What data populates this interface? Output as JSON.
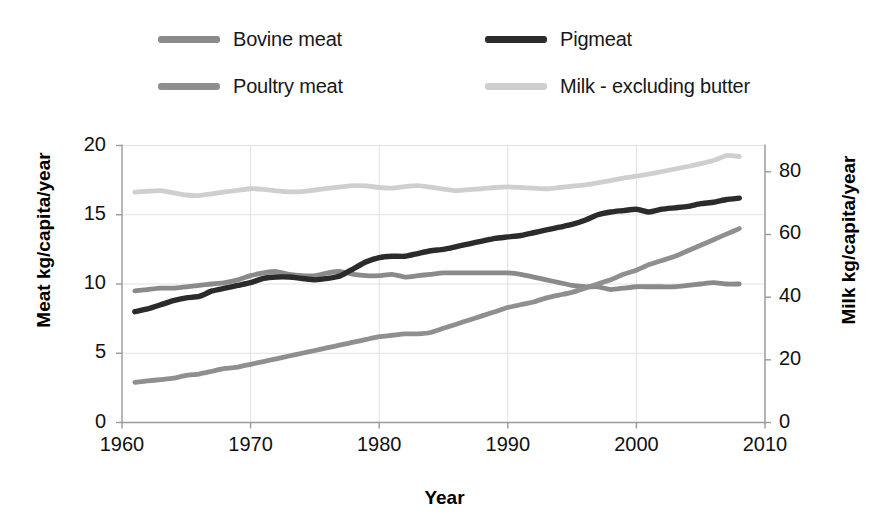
{
  "chart_data": {
    "type": "line",
    "title": "",
    "xlabel": "Year",
    "ylabel": "Meat kg/capita/year",
    "ylabel_secondary": "Milk kg/capita/year",
    "xlim": [
      1960,
      2010
    ],
    "ylim": [
      0,
      20
    ],
    "ylim_secondary": [
      0,
      88.4
    ],
    "xticks": [
      "1960",
      "1970",
      "1980",
      "1990",
      "2000",
      "2010"
    ],
    "xtick_values": [
      1960,
      1970,
      1980,
      1990,
      2000,
      2010
    ],
    "yticks": [
      "0",
      "5",
      "10",
      "15",
      "20"
    ],
    "ytick_values": [
      0,
      5,
      10,
      15,
      20
    ],
    "yticks_secondary": [
      "0",
      "20",
      "40",
      "60",
      "80"
    ],
    "ytick_values_secondary": [
      0,
      20,
      40,
      60,
      80
    ],
    "grid": true,
    "legend_position": "top",
    "x": [
      1961,
      1962,
      1963,
      1964,
      1965,
      1966,
      1967,
      1968,
      1969,
      1970,
      1971,
      1972,
      1973,
      1974,
      1975,
      1976,
      1977,
      1978,
      1979,
      1980,
      1981,
      1982,
      1983,
      1984,
      1985,
      1986,
      1987,
      1988,
      1989,
      1990,
      1991,
      1992,
      1993,
      1994,
      1995,
      1996,
      1997,
      1998,
      1999,
      2000,
      2001,
      2002,
      2003,
      2004,
      2005,
      2006,
      2007,
      2008
    ],
    "series": [
      {
        "name": "Bovine meat",
        "axis": "left",
        "color": "#8a8a8a",
        "values": [
          9.5,
          9.6,
          9.7,
          9.7,
          9.8,
          9.9,
          10.0,
          10.1,
          10.3,
          10.6,
          10.8,
          10.9,
          10.7,
          10.6,
          10.6,
          10.8,
          10.9,
          10.7,
          10.6,
          10.6,
          10.7,
          10.5,
          10.6,
          10.7,
          10.8,
          10.8,
          10.8,
          10.8,
          10.8,
          10.8,
          10.7,
          10.5,
          10.3,
          10.1,
          9.9,
          9.8,
          9.8,
          9.6,
          9.7,
          9.8,
          9.8,
          9.8,
          9.8,
          9.9,
          10.0,
          10.1,
          10.0,
          10.0
        ]
      },
      {
        "name": "Pigmeat",
        "axis": "left",
        "color": "#2b2b2b",
        "values": [
          8.0,
          8.2,
          8.5,
          8.8,
          9.0,
          9.1,
          9.5,
          9.7,
          9.9,
          10.1,
          10.4,
          10.5,
          10.5,
          10.4,
          10.3,
          10.4,
          10.6,
          11.1,
          11.6,
          11.9,
          12.0,
          12.0,
          12.2,
          12.4,
          12.5,
          12.7,
          12.9,
          13.1,
          13.3,
          13.4,
          13.5,
          13.7,
          13.9,
          14.1,
          14.3,
          14.6,
          15.0,
          15.2,
          15.3,
          15.4,
          15.2,
          15.4,
          15.5,
          15.6,
          15.8,
          15.9,
          16.1,
          16.2
        ]
      },
      {
        "name": "Poultry meat",
        "axis": "left",
        "color": "#8f8f8f",
        "values": [
          2.9,
          3.0,
          3.1,
          3.2,
          3.4,
          3.5,
          3.7,
          3.9,
          4.0,
          4.2,
          4.4,
          4.6,
          4.8,
          5.0,
          5.2,
          5.4,
          5.6,
          5.8,
          6.0,
          6.2,
          6.3,
          6.4,
          6.4,
          6.5,
          6.8,
          7.1,
          7.4,
          7.7,
          8.0,
          8.3,
          8.5,
          8.7,
          9.0,
          9.2,
          9.4,
          9.7,
          10.0,
          10.3,
          10.7,
          11.0,
          11.4,
          11.7,
          12.0,
          12.4,
          12.8,
          13.2,
          13.6,
          14.0
        ]
      },
      {
        "name": "Milk - excluding butter",
        "axis": "right",
        "color": "#cfcfcf",
        "values": [
          73.5,
          73.8,
          74.0,
          73.3,
          72.6,
          72.4,
          73.0,
          73.6,
          74.1,
          74.6,
          74.4,
          73.9,
          73.6,
          73.7,
          74.2,
          74.7,
          75.2,
          75.6,
          75.5,
          75.0,
          74.8,
          75.3,
          75.6,
          75.1,
          74.5,
          74.0,
          74.3,
          74.6,
          75.0,
          75.2,
          75.0,
          74.8,
          74.6,
          75.0,
          75.4,
          75.8,
          76.5,
          77.2,
          78.0,
          78.6,
          79.3,
          80.1,
          80.9,
          81.7,
          82.6,
          83.6,
          85.2,
          84.9
        ]
      }
    ]
  },
  "legend": {
    "items": [
      {
        "label": "Bovine meat"
      },
      {
        "label": "Pigmeat"
      },
      {
        "label": "Poultry meat"
      },
      {
        "label": "Milk - excluding butter"
      }
    ]
  },
  "axes": {
    "x_title": "Year",
    "y_left_title": "Meat kg/capita/year",
    "y_right_title": "Milk kg/capita/year"
  },
  "colors": {
    "bovine": "#8a8a8a",
    "pigmeat": "#2b2b2b",
    "poultry": "#8f8f8f",
    "milk": "#cfcfcf",
    "axis": "#9a9a9a",
    "grid": "#e2e2e2",
    "text": "#111111"
  }
}
